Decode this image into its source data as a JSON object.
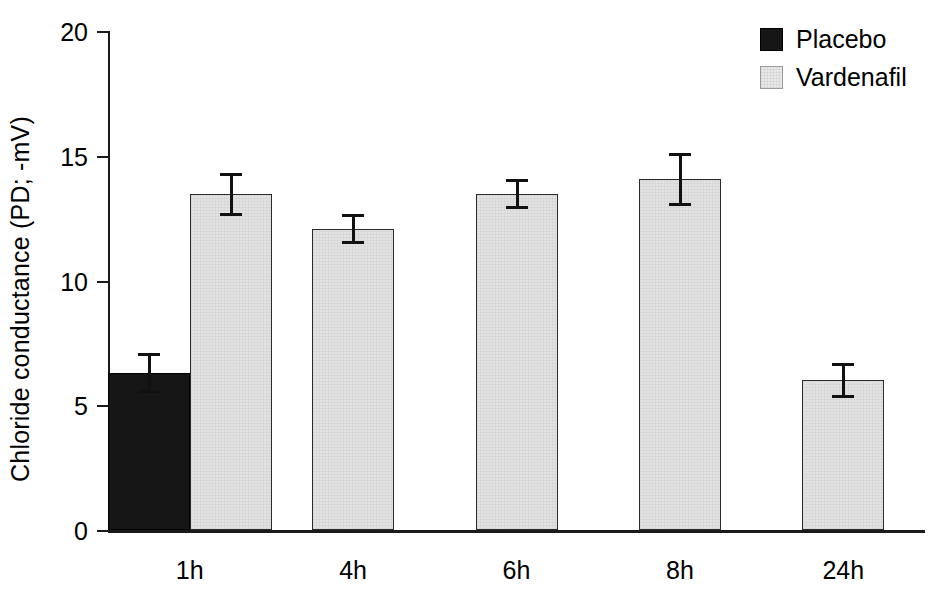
{
  "chart_data": {
    "type": "bar",
    "title": "",
    "xlabel": "",
    "ylabel": "Chloride conductance  (PD; -mV)",
    "categories": [
      "1h",
      "4h",
      "6h",
      "8h",
      "24h"
    ],
    "ylim": [
      0,
      20
    ],
    "yticks": [
      0,
      5,
      10,
      15,
      20
    ],
    "ytick_labels": [
      "0",
      "5",
      "10",
      "15",
      "20"
    ],
    "grid": false,
    "legend_position": "top-right",
    "series": [
      {
        "name": "Placebo",
        "color": "#161616",
        "values": [
          6.3,
          null,
          null,
          null,
          null
        ],
        "errors": [
          0.8,
          null,
          null,
          null,
          null
        ]
      },
      {
        "name": "Vardenafil",
        "color": "#e2e2e2",
        "values": [
          13.45,
          12.05,
          13.45,
          14.05,
          6.0
        ],
        "errors": [
          0.85,
          0.6,
          0.6,
          1.05,
          0.7
        ]
      }
    ]
  },
  "legend": {
    "items": [
      {
        "label": "Placebo",
        "swatch": "black-square-swatch"
      },
      {
        "label": "Vardenafil",
        "swatch": "gray-square-swatch"
      }
    ]
  },
  "axes": {
    "y_title": "Chloride conductance  (PD; -mV)"
  }
}
